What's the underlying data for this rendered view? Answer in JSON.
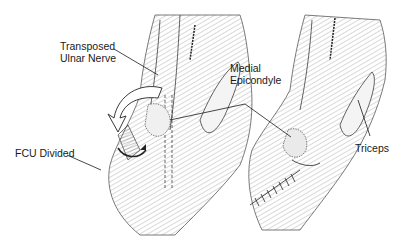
{
  "figure": {
    "panels": [
      {
        "id": "left",
        "content": "FCU divided, ulnar nerve transposed anteriorly over medial epicondyle (curved arrows)"
      },
      {
        "id": "right",
        "content": "FCU repaired with sutures over transposed nerve; triceps visible"
      }
    ],
    "labels": {
      "transposed_line1": "Transposed",
      "transposed_line2": "Ulnar Nerve",
      "medial_line1": "Medial",
      "medial_line2": "Epicondyle",
      "fcu": "FCU Divided",
      "triceps": "Triceps"
    },
    "colors": {
      "ink": "#1a1a1a",
      "background": "#ffffff",
      "shade": "#dcdcdc"
    }
  }
}
